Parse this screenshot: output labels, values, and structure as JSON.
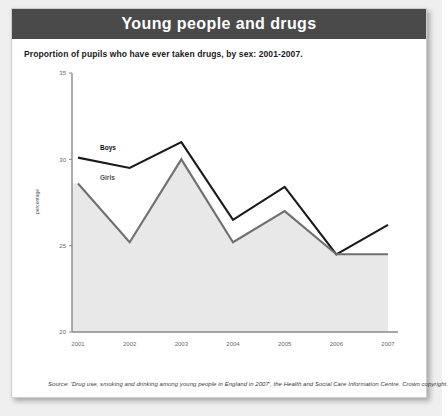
{
  "header": {
    "title": "Young people and drugs",
    "bar_color": "#4a4a4a",
    "text_color": "#ffffff"
  },
  "subtitle": "Proportion of pupils who have ever taken drugs, by sex: 2001-2007.",
  "source": "Source: 'Drug use, smoking and drinking among young people in England in 2007', the Health and Social Care Information Centre. Crown copyright.",
  "chart_data": {
    "type": "line",
    "title": "Young people and drugs",
    "subtitle": "Proportion of pupils who have ever taken drugs, by sex: 2001-2007.",
    "xlabel": "",
    "ylabel": "percentage",
    "categories": [
      "2001",
      "2002",
      "2003",
      "2004",
      "2005",
      "2006",
      "2007"
    ],
    "ylim": [
      20,
      35
    ],
    "yticks": [
      "20",
      "25",
      "30",
      "35"
    ],
    "ytick_values": [
      20,
      25,
      30,
      35
    ],
    "grid": false,
    "legend_position": "inline-labels",
    "area_fill": true,
    "series": [
      {
        "name": "Boys",
        "color": "#1a1a1a",
        "values": [
          30.1,
          29.5,
          31.0,
          26.5,
          28.4,
          24.5,
          26.2
        ]
      },
      {
        "name": "Girls",
        "color": "#707070",
        "values": [
          28.6,
          25.2,
          30.0,
          25.2,
          27.0,
          24.5,
          24.5
        ]
      }
    ],
    "annotations": [
      {
        "text": "Boys",
        "series": "Boys"
      },
      {
        "text": "Girls",
        "series": "Girls"
      }
    ]
  }
}
